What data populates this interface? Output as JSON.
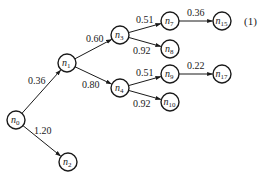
{
  "diagram": {
    "type": "tree",
    "equation_label": "(1)",
    "nodes": [
      {
        "id": "n0",
        "name": "n",
        "sub": "0"
      },
      {
        "id": "n1",
        "name": "n",
        "sub": "1"
      },
      {
        "id": "n2",
        "name": "n",
        "sub": "2"
      },
      {
        "id": "n3",
        "name": "n",
        "sub": "3"
      },
      {
        "id": "n4",
        "name": "n",
        "sub": "4"
      },
      {
        "id": "n7",
        "name": "n",
        "sub": "7"
      },
      {
        "id": "n8",
        "name": "n",
        "sub": "8"
      },
      {
        "id": "n9",
        "name": "n",
        "sub": "9"
      },
      {
        "id": "n10",
        "name": "n",
        "sub": "10"
      },
      {
        "id": "n15",
        "name": "n",
        "sub": "15"
      },
      {
        "id": "n17",
        "name": "n",
        "sub": "17"
      }
    ],
    "edges": [
      {
        "from": "n0",
        "to": "n1",
        "label": "0.36"
      },
      {
        "from": "n0",
        "to": "n2",
        "label": "1.20"
      },
      {
        "from": "n1",
        "to": "n3",
        "label": "0.60"
      },
      {
        "from": "n1",
        "to": "n4",
        "label": "0.80"
      },
      {
        "from": "n3",
        "to": "n7",
        "label": "0.51"
      },
      {
        "from": "n3",
        "to": "n8",
        "label": "0.92"
      },
      {
        "from": "n4",
        "to": "n9",
        "label": "0.51"
      },
      {
        "from": "n4",
        "to": "n10",
        "label": "0.92"
      },
      {
        "from": "n7",
        "to": "n15",
        "label": "0.36"
      },
      {
        "from": "n9",
        "to": "n17",
        "label": "0.22"
      }
    ]
  }
}
